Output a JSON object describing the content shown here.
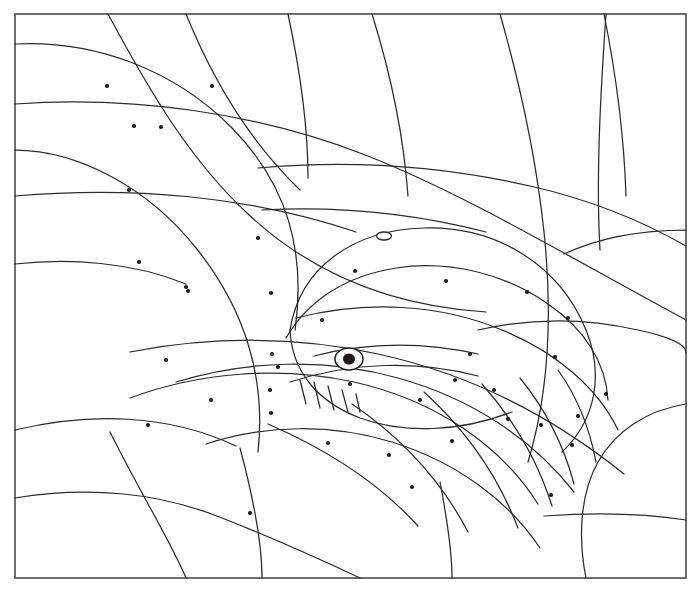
{
  "page": {
    "kind": "line-art-coloring-page",
    "background_color": "#ffffff",
    "line_color": "#2b2b2b",
    "frame_color": "#4a4a4a",
    "dot_color": "#1a1a1a",
    "width": 700,
    "height": 594
  },
  "frame": {
    "x": 15,
    "y": 14,
    "width": 671,
    "height": 564
  },
  "whale": {
    "eye": {
      "cx": 349,
      "cy": 359,
      "rx": 14,
      "ry": 11,
      "pupil_rx": 6,
      "pupil_ry": 5.5
    },
    "blowhole": {
      "cx": 384,
      "cy": 236,
      "rx": 7.5,
      "ry": 4
    },
    "teeth_count": 5
  },
  "background_curves": [
    "M15,44 C95,40 175,70 232,128 C288,185 306,252 295,330",
    "M15,150 C80,150 150,190 196,248 C246,310 266,380 258,452",
    "M15,264 C70,258 132,262 186,284",
    "M15,430 C90,412 168,414 236,446",
    "M108,14 C150,92 190,160 248,214 C312,274 392,306 486,312",
    "M186,14 C212,78 248,140 300,190",
    "M288,14 C300,70 308,124 308,178",
    "M372,14 C392,78 404,140 408,196",
    "M500,14 C520,84 536,156 544,232 C553,318 548,396 528,462",
    "M604,14 C616,74 624,134 626,196",
    "M15,104 C132,96 256,112 368,156 C468,196 560,252 686,320",
    "M15,196 C130,186 250,196 356,232",
    "M258,168 C348,160 442,166 530,186 C592,200 644,222 686,246",
    "M262,210 C338,206 416,214 486,232",
    "M130,352 C212,336 298,336 378,354 C470,374 552,416 624,474",
    "M15,498 C86,486 158,492 222,518 C278,540 326,562 360,578",
    "M110,432 C142,496 170,540 186,578",
    "M240,448 C256,508 262,548 262,578",
    "M440,482 C448,524 452,554 452,578",
    "M686,404 C648,410 616,430 598,462 C580,494 578,538 586,578",
    "M544,516 C600,512 648,514 686,520",
    "M478,330 C530,318 586,318 638,330 C666,336 686,344 686,352",
    "M606,14 C600,100 596,180 600,250",
    "M686,230 C640,230 598,238 564,254"
  ],
  "whale_body": [
    "M290,330 C300,268 352,230 424,228 C498,226 560,266 586,330 C604,374 596,420 562,452",
    "M290,330 C292,372 318,402 360,418 C404,434 460,432 512,412",
    "M286,338 C308,300 346,276 396,268 C450,260 506,274 548,304 C586,330 606,364 608,400",
    "M296,318 C366,300 440,304 502,330 C556,352 598,388 618,430",
    "M176,382 C248,360 326,358 398,378 C470,398 532,438 574,492",
    "M130,398 C200,372 280,366 354,382 C434,400 500,444 538,504",
    "M206,444 C266,424 332,424 392,442 C456,462 508,500 540,548",
    "M268,424 C328,450 380,484 418,526",
    "M352,404 C402,438 442,482 468,532",
    "M424,392 C466,430 498,476 518,528",
    "M482,384 C514,420 538,462 552,506",
    "M520,378 C546,410 564,446 574,484",
    "M558,370 C578,398 590,430 596,462",
    "M290,382 C352,362 418,360 478,376",
    "M314,356 C368,342 424,342 478,354"
  ],
  "teeth": [
    "M300,380 L306,404",
    "M314,382 L320,408",
    "M328,386 L334,410",
    "M342,390 L348,412",
    "M356,394 L360,412"
  ],
  "dots": [
    {
      "x": 107,
      "y": 86
    },
    {
      "x": 212,
      "y": 86
    },
    {
      "x": 134,
      "y": 126
    },
    {
      "x": 161,
      "y": 127
    },
    {
      "x": 129,
      "y": 190
    },
    {
      "x": 258,
      "y": 238
    },
    {
      "x": 139,
      "y": 262
    },
    {
      "x": 186,
      "y": 287
    },
    {
      "x": 188,
      "y": 291
    },
    {
      "x": 271,
      "y": 293
    },
    {
      "x": 355,
      "y": 271
    },
    {
      "x": 446,
      "y": 281
    },
    {
      "x": 527,
      "y": 292
    },
    {
      "x": 322,
      "y": 320
    },
    {
      "x": 568,
      "y": 318
    },
    {
      "x": 166,
      "y": 360
    },
    {
      "x": 272,
      "y": 354
    },
    {
      "x": 470,
      "y": 354
    },
    {
      "x": 555,
      "y": 357
    },
    {
      "x": 278,
      "y": 367
    },
    {
      "x": 211,
      "y": 400
    },
    {
      "x": 270,
      "y": 390
    },
    {
      "x": 271,
      "y": 413
    },
    {
      "x": 350,
      "y": 384
    },
    {
      "x": 455,
      "y": 380
    },
    {
      "x": 494,
      "y": 390
    },
    {
      "x": 420,
      "y": 400
    },
    {
      "x": 508,
      "y": 419
    },
    {
      "x": 541,
      "y": 425
    },
    {
      "x": 578,
      "y": 416
    },
    {
      "x": 606,
      "y": 394
    },
    {
      "x": 148,
      "y": 425
    },
    {
      "x": 328,
      "y": 443
    },
    {
      "x": 389,
      "y": 455
    },
    {
      "x": 452,
      "y": 441
    },
    {
      "x": 572,
      "y": 445
    },
    {
      "x": 412,
      "y": 487
    },
    {
      "x": 551,
      "y": 495
    },
    {
      "x": 250,
      "y": 513
    }
  ]
}
